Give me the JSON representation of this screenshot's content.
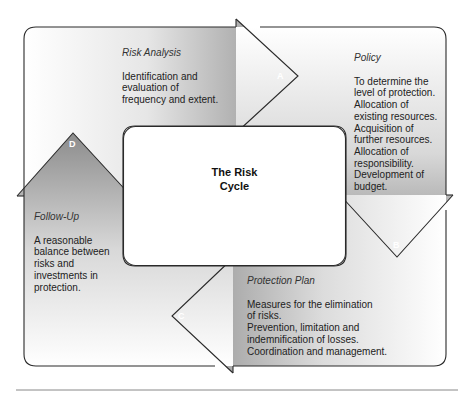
{
  "diagram": {
    "title": "The Risk Cycle",
    "center": {
      "line1": "The Risk",
      "line2": "Cycle"
    },
    "stages": [
      {
        "letter": "A",
        "title": "Risk Analysis",
        "lines": [
          "Identification and",
          "evaluation of",
          "frequency and extent."
        ]
      },
      {
        "letter": "B",
        "title": "Policy",
        "lines": [
          "To determine the",
          "level of protection.",
          "Allocation of",
          "existing resources.",
          "Acquisition of",
          "further resources.",
          "Allocation of",
          "responsibility.",
          "Development of",
          "budget."
        ]
      },
      {
        "letter": "C",
        "title": "Protection Plan",
        "lines": [
          "Measures for the elimination",
          "of risks.",
          "Prevention, limitation and",
          "indemnification of losses.",
          "Coordination and management."
        ]
      },
      {
        "letter": "D",
        "title": "Follow-Up",
        "lines": [
          "A reasonable",
          "balance between",
          "risks and",
          "investments in",
          "protection."
        ]
      }
    ],
    "colors": {
      "arrow_dark": "#8a8a8a",
      "arrow_light": "#ffffff",
      "outline": "#2a2a2a",
      "footer_rule": "#888888"
    }
  }
}
